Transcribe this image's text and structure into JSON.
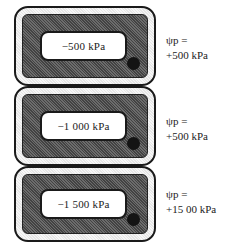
{
  "diagram": {
    "type": "plant-cells-turgor-pressure",
    "cells": [
      {
        "vacuole_label": "−500 kPa",
        "psi_label": "ψp =",
        "psi_value": "+500 kPa"
      },
      {
        "vacuole_label": "−1 000 kPa",
        "psi_label": "ψp =",
        "psi_value": "+500 kPa"
      },
      {
        "vacuole_label": "−1 500 kPa",
        "psi_label": "ψp =",
        "psi_value": "+15 00 kPa"
      }
    ],
    "colors": {
      "outline": "#1a1a1a",
      "cell_wall_fill": "#eeeeee",
      "cytoplasm_fill": "#8a8a8a",
      "vacuole_fill": "#ffffff",
      "nucleus": "#141414"
    }
  }
}
